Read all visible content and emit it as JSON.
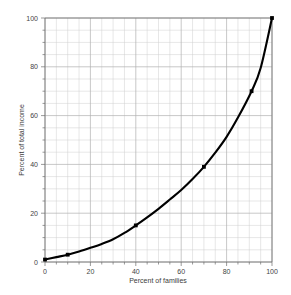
{
  "chart_data": {
    "type": "line",
    "title": "",
    "xlabel": "Percent of families",
    "ylabel": "Percent of total income",
    "xlim": [
      0,
      100
    ],
    "ylim": [
      0,
      100
    ],
    "grid": true,
    "grid_minor_step": 5,
    "grid_major_step": 20,
    "legend": "none",
    "xticks": [
      0,
      20,
      40,
      60,
      80,
      100
    ],
    "xticklabels": [
      "0",
      "20",
      "40",
      "60",
      "80",
      "100"
    ],
    "yticks": [
      0,
      20,
      40,
      60,
      80,
      100
    ],
    "yticklabels": [
      "0",
      "20",
      "40",
      "60",
      "80",
      "100"
    ],
    "series": [
      {
        "name": "Lorenz curve",
        "color": "#000000",
        "marker": "square",
        "x": [
          0,
          10,
          40,
          70,
          91,
          100
        ],
        "y": [
          1,
          3,
          15,
          39,
          70,
          100
        ],
        "marked_points": [
          {
            "x": 0,
            "y": 1
          },
          {
            "x": 10,
            "y": 3
          },
          {
            "x": 40,
            "y": 15
          },
          {
            "x": 70,
            "y": 39
          },
          {
            "x": 91,
            "y": 70
          },
          {
            "x": 100,
            "y": 100
          }
        ],
        "smoothed_x": [
          0,
          5,
          10,
          15,
          20,
          25,
          30,
          35,
          40,
          45,
          50,
          55,
          60,
          65,
          70,
          75,
          80,
          85,
          91,
          95,
          100
        ],
        "smoothed_y": [
          1,
          2,
          3,
          4.3,
          5.8,
          7.4,
          9.3,
          11.9,
          15,
          18.3,
          21.8,
          25.6,
          29.5,
          34.0,
          39,
          44.8,
          51.3,
          59.2,
          70,
          79.5,
          100
        ]
      }
    ]
  },
  "axis": {
    "x_title": "Percent of families",
    "y_title": "Percent of total income",
    "x_labels": [
      "0",
      "20",
      "40",
      "60",
      "80",
      "100"
    ],
    "y_labels": [
      "0",
      "20",
      "40",
      "60",
      "80",
      "100"
    ]
  },
  "colors": {
    "curve": "#000000",
    "grid_minor": "#cfcfcf",
    "grid_major": "#b0b0b0",
    "axis": "#6f6f6f",
    "text": "#444444",
    "background": "#ffffff"
  }
}
